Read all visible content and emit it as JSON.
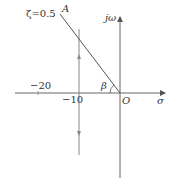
{
  "diagram": {
    "type": "root-locus-s-plane",
    "labels": {
      "damping_line": "ζ=0.5",
      "point_a": "A",
      "imag_axis": "jω",
      "real_axis": "σ",
      "origin": "O",
      "angle": "β",
      "tick_minus_20": "−20",
      "tick_minus_10": "−10"
    },
    "colors": {
      "line": "#555555",
      "text": "#333333",
      "background": "#ffffff"
    }
  }
}
